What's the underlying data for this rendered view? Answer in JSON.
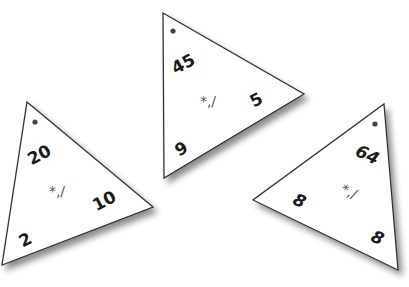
{
  "scene": "Three triangular multiplication/division fact family cards",
  "colors": {
    "card": "#ffffff",
    "edge": "#333333",
    "text": "#1a1a1a",
    "operator": "#555555",
    "shadow": "#9a9a9a"
  },
  "cards": [
    {
      "id": "left",
      "top_number": "20",
      "right_number": "10",
      "bottom_number": "2",
      "operators": "*,/"
    },
    {
      "id": "middle",
      "top_number": "45",
      "right_number": "5",
      "bottom_number": "9",
      "operators": "*,/"
    },
    {
      "id": "right",
      "top_number": "64",
      "left_number": "8",
      "bottom_number": "8",
      "operators": "*,/"
    }
  ]
}
